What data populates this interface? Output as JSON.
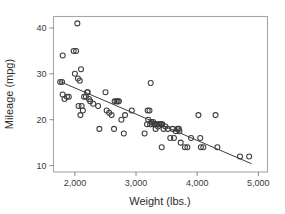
{
  "chart_data": {
    "type": "scatter",
    "title": "",
    "subtitle": "",
    "xlabel": "Weight (lbs.)",
    "ylabel": "Mileage (mpg)",
    "xlim": [
      1650,
      5150
    ],
    "ylim": [
      8.6,
      42.5
    ],
    "xticks": [
      2000,
      3000,
      4000,
      5000
    ],
    "xtick_labels": [
      "2,000",
      "3,000",
      "4,000",
      "5,000"
    ],
    "yticks": [
      10,
      20,
      30,
      40
    ],
    "ytick_labels": [
      "10",
      "20",
      "30",
      "40"
    ],
    "grid": false,
    "legend": null,
    "marker": "open-circle",
    "marker_color": "#3d3d3d",
    "frame_color": "#a6a6a6",
    "annotations": [],
    "series": [
      {
        "name": "Cars",
        "marker": "open-circle",
        "points": [
          [
            1760,
            28.2
          ],
          [
            1790,
            28.2
          ],
          [
            1800,
            34.0
          ],
          [
            1800,
            25.5
          ],
          [
            1830,
            24.5
          ],
          [
            1870,
            25.0
          ],
          [
            1900,
            25.0
          ],
          [
            1980,
            35.0
          ],
          [
            2020,
            35.0
          ],
          [
            2000,
            30.0
          ],
          [
            2040,
            41.0
          ],
          [
            2050,
            29.0
          ],
          [
            2060,
            23.0
          ],
          [
            2080,
            28.5
          ],
          [
            2090,
            21.0
          ],
          [
            2100,
            31.0
          ],
          [
            2110,
            23.0
          ],
          [
            2130,
            22.0
          ],
          [
            2150,
            25.0
          ],
          [
            2180,
            25.0
          ],
          [
            2200,
            26.0
          ],
          [
            2210,
            26.0
          ],
          [
            2230,
            24.5
          ],
          [
            2250,
            24.0
          ],
          [
            2300,
            23.5
          ],
          [
            2380,
            23.0
          ],
          [
            2400,
            18.0
          ],
          [
            2500,
            26.0
          ],
          [
            2520,
            22.0
          ],
          [
            2560,
            21.5
          ],
          [
            2600,
            21.0
          ],
          [
            2640,
            18.0
          ],
          [
            2650,
            24.0
          ],
          [
            2680,
            24.0
          ],
          [
            2700,
            24.0
          ],
          [
            2720,
            24.0
          ],
          [
            2760,
            20.0
          ],
          [
            2800,
            17.0
          ],
          [
            2820,
            21.0
          ],
          [
            2930,
            22.0
          ],
          [
            3140,
            17.0
          ],
          [
            3180,
            19.0
          ],
          [
            3190,
            22.0
          ],
          [
            3200,
            20.0
          ],
          [
            3220,
            22.0
          ],
          [
            3230,
            19.0
          ],
          [
            3240,
            28.0
          ],
          [
            3250,
            19.5
          ],
          [
            3260,
            19.0
          ],
          [
            3280,
            19.5
          ],
          [
            3300,
            19.0
          ],
          [
            3320,
            18.0
          ],
          [
            3330,
            19.0
          ],
          [
            3350,
            19.0
          ],
          [
            3360,
            18.5
          ],
          [
            3380,
            19.0
          ],
          [
            3400,
            19.0
          ],
          [
            3410,
            19.0
          ],
          [
            3420,
            14.0
          ],
          [
            3430,
            19.0
          ],
          [
            3450,
            18.0
          ],
          [
            3480,
            18.5
          ],
          [
            3520,
            18.0
          ],
          [
            3560,
            16.0
          ],
          [
            3600,
            18.0
          ],
          [
            3620,
            16.0
          ],
          [
            3650,
            17.5
          ],
          [
            3680,
            18.0
          ],
          [
            3700,
            18.0
          ],
          [
            3710,
            17.5
          ],
          [
            3730,
            15.0
          ],
          [
            3800,
            14.0
          ],
          [
            3840,
            14.0
          ],
          [
            3900,
            16.0
          ],
          [
            4020,
            21.0
          ],
          [
            4050,
            16.0
          ],
          [
            4060,
            14.0
          ],
          [
            4100,
            14.0
          ],
          [
            4300,
            21.0
          ],
          [
            4330,
            14.0
          ],
          [
            4700,
            12.0
          ],
          [
            4850,
            12.0
          ]
        ]
      }
    ],
    "fit_line": {
      "type": "linear-regression",
      "x_start": 1760,
      "y_start": 28.3,
      "x_end": 4890,
      "y_end": 10.4
    }
  }
}
